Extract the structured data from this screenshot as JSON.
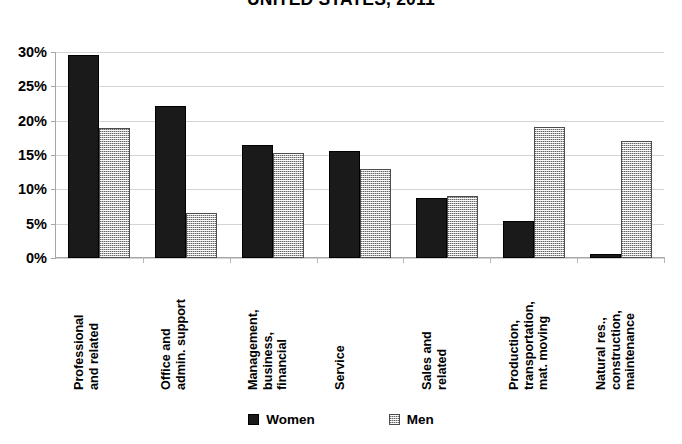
{
  "chart_data": {
    "type": "bar",
    "title": "UNITED STATES, 2011",
    "xlabel": "",
    "ylabel": "",
    "ylim": [
      0,
      30
    ],
    "ytick_labels": [
      "0%",
      "5%",
      "10%",
      "15%",
      "20%",
      "25%",
      "30%"
    ],
    "ytick_values": [
      0,
      5,
      10,
      15,
      20,
      25,
      30
    ],
    "grid": true,
    "legend_position": "bottom",
    "categories": [
      "Professional and related",
      "Office and admin. support",
      "Management, business, financial",
      "Service",
      "Sales and related",
      "Production, transportation, mat. moving",
      "Natural res., construction, maintenance"
    ],
    "category_lines": [
      [
        "Professional",
        "and related"
      ],
      [
        "Office and",
        "admin. support"
      ],
      [
        "Management,",
        "business,",
        "financial"
      ],
      [
        "Service"
      ],
      [
        "Sales and",
        "related"
      ],
      [
        "Production,",
        "transportation,",
        "mat. moving"
      ],
      [
        "Natural res.,",
        "construction,",
        "maintenance"
      ]
    ],
    "series": [
      {
        "name": "Women",
        "color": "#1a1a1a",
        "values": [
          29.5,
          22.2,
          16.5,
          15.6,
          8.8,
          5.4,
          0.6
        ]
      },
      {
        "name": "Men",
        "color": "#b8b8b8",
        "values": [
          18.9,
          6.6,
          15.3,
          13.0,
          9.1,
          19.1,
          17.0
        ]
      }
    ]
  },
  "legend": {
    "items": [
      {
        "label": "Women",
        "swatch": "women"
      },
      {
        "label": "Men",
        "swatch": "men"
      }
    ]
  }
}
